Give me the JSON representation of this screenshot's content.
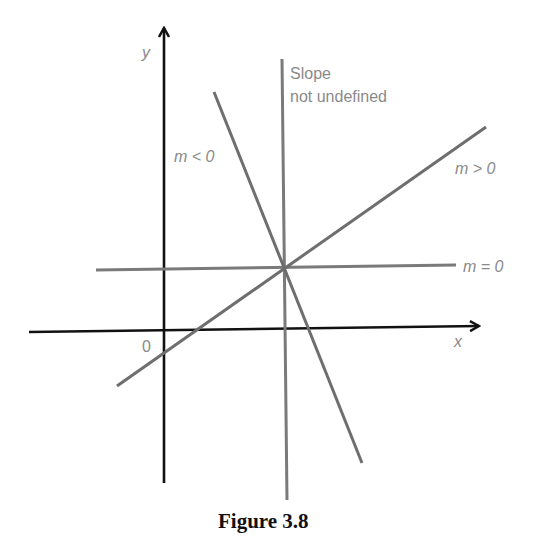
{
  "figure": {
    "caption": "Figure 3.8",
    "axes": {
      "x_label": "x",
      "y_label": "y",
      "origin_label": "0",
      "color": "#111111"
    },
    "lines": [
      {
        "id": "vertical",
        "label_line1": "Slope",
        "label_line2": "not undefined",
        "color": "#7a7a7a"
      },
      {
        "id": "negative",
        "label": "m < 0",
        "color": "#6e6e6e"
      },
      {
        "id": "positive",
        "label": "m > 0",
        "color": "#6e6e6e"
      },
      {
        "id": "horizontal",
        "label": "m = 0",
        "color": "#7a7a7a"
      }
    ]
  }
}
